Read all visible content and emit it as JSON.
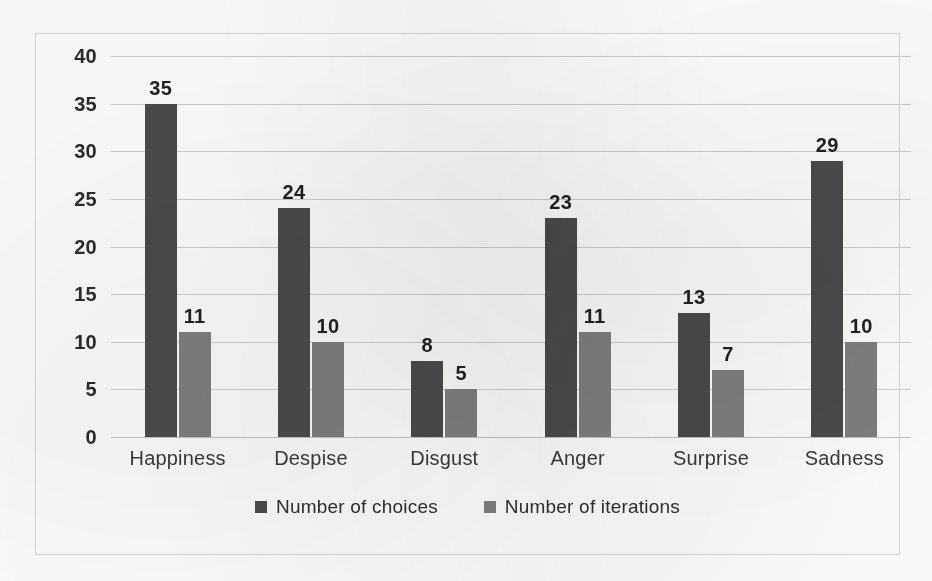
{
  "chart_data": {
    "type": "bar",
    "title": "",
    "subtitle": "",
    "xlabel": "",
    "ylabel": "",
    "categories": [
      "Happiness",
      "Despise",
      "Disgust",
      "Anger",
      "Surprise",
      "Sadness"
    ],
    "series": [
      {
        "name": "Number of choices",
        "color": "#4b4b4b",
        "values": [
          35,
          24,
          8,
          23,
          13,
          29
        ]
      },
      {
        "name": "Number of iterations",
        "color": "#7f7f7f",
        "values": [
          11,
          10,
          5,
          11,
          7,
          10
        ]
      }
    ],
    "ylim": [
      0,
      40
    ],
    "ytick_step": 5,
    "yticks": [
      "40",
      "35",
      "30",
      "25",
      "20",
      "15",
      "10",
      "5",
      "0"
    ],
    "grid": true,
    "grid_axis": "y",
    "legend_position": "bottom",
    "data_labels": true,
    "annotations": []
  },
  "colors": {
    "series_choices": "#4b4b4b",
    "series_iterations": "#7f7f7f",
    "gridline": "#cfcfcf",
    "frame_border": "#d8d8d8",
    "background": "#fdfdfc",
    "text": "#2b2b2b"
  },
  "legend": {
    "items": [
      {
        "label": "Number of choices",
        "marker": "square-swatch-dark"
      },
      {
        "label": "Number of iterations",
        "marker": "square-swatch-gray"
      }
    ]
  }
}
